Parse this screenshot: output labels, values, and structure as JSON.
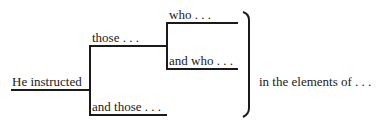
{
  "diagram": {
    "root": "He instructed",
    "branch_top": "those . . .",
    "branch_top_sub1": "who . . .",
    "branch_top_sub2": "and who . . .",
    "branch_bottom": "and those . . .",
    "continuation": "in the elements of . . ."
  }
}
